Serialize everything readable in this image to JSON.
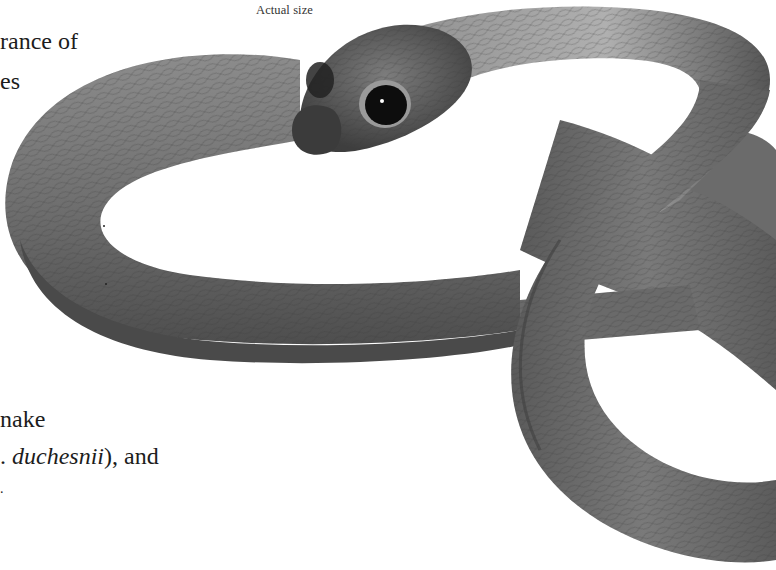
{
  "page": {
    "caption": "Actual size",
    "text_fragments": [
      "rance of",
      "es",
      "nake",
      {
        "prefix": ". ",
        "italic": "duchesnii",
        "suffix": "), and"
      },
      "."
    ]
  },
  "figure": {
    "style": "grayscale",
    "colors": {
      "body_dark": "#4a4a4a",
      "body_mid": "#6e6e6e",
      "body_light": "#a9a9a9",
      "eye": "#0d0d0d",
      "background": "#ffffff"
    }
  }
}
